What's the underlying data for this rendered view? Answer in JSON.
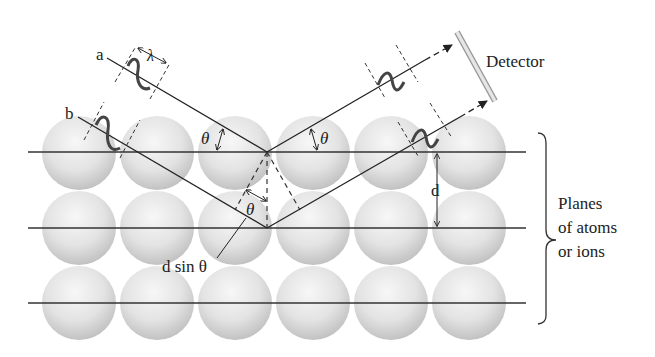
{
  "diagram": {
    "labels": {
      "ray_a": "a",
      "ray_b": "b",
      "wavelength": "λ",
      "theta": "θ",
      "spacing": "d",
      "path_difference": "d sin θ",
      "detector": "Detector",
      "planes_line1": "Planes",
      "planes_line2": "of atoms",
      "planes_line3": "or ions"
    },
    "layout": {
      "rows": 3,
      "atoms_per_row": 6,
      "plane_y": [
        152,
        228,
        303
      ],
      "colors": {
        "line": "#333333",
        "atom_light": "#f4f4f4",
        "atom_dark": "#c4c4c4",
        "wave": "#444444",
        "detector": "#d8d8d8"
      }
    }
  }
}
